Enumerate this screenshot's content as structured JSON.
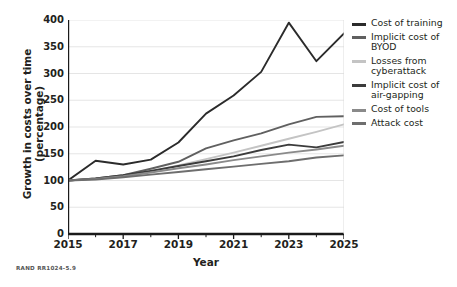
{
  "chart_data": {
    "type": "line",
    "title": "",
    "xlabel": "Year",
    "ylabel": "Growth in costs over time (percentage)",
    "ylabel_lines": [
      "Growth in costs over time",
      "(percentage)"
    ],
    "x": [
      2015,
      2016,
      2017,
      2018,
      2019,
      2020,
      2021,
      2022,
      2023,
      2024,
      2025
    ],
    "xlim": [
      2015,
      2025
    ],
    "ylim": [
      0,
      400
    ],
    "yticks": [
      0,
      50,
      100,
      150,
      200,
      250,
      300,
      350,
      400
    ],
    "xticks_major": [
      2015,
      2017,
      2019,
      2021,
      2023,
      2025
    ],
    "xticks_minor": [
      2016,
      2018,
      2020,
      2022,
      2024
    ],
    "grid": "horizontal",
    "legend_position": "right",
    "series": [
      {
        "name": "Cost of training",
        "color": "#2b2b2b",
        "values": [
          100,
          137,
          130,
          139,
          171,
          225,
          259,
          303,
          395,
          323,
          375
        ]
      },
      {
        "name": "Implicit cost of BYOD",
        "color": "#606060",
        "values": [
          100,
          104,
          110,
          122,
          135,
          160,
          175,
          188,
          205,
          219,
          220
        ]
      },
      {
        "name": "Losses from cyberattack",
        "color": "#c4c4c4",
        "values": [
          100,
          103,
          107,
          117,
          128,
          140,
          152,
          165,
          178,
          191,
          205
        ]
      },
      {
        "name": "Implicit cost of air-gapping",
        "color": "#3c3c3c",
        "values": [
          100,
          104,
          110,
          118,
          127,
          136,
          145,
          157,
          167,
          162,
          172
        ]
      },
      {
        "name": "Cost of tools",
        "color": "#8a8a8a",
        "values": [
          100,
          103,
          108,
          115,
          123,
          130,
          138,
          145,
          152,
          158,
          165
        ]
      },
      {
        "name": "Attack cost",
        "color": "#6e6e6e",
        "values": [
          100,
          102,
          106,
          111,
          116,
          121,
          126,
          131,
          136,
          143,
          147
        ]
      }
    ]
  },
  "legend": {
    "items": [
      {
        "label_lines": [
          "Cost of training"
        ]
      },
      {
        "label_lines": [
          "Implicit cost of",
          "BYOD"
        ]
      },
      {
        "label_lines": [
          "Losses from",
          "cyberattack"
        ]
      },
      {
        "label_lines": [
          "Implicit cost of",
          "air-gapping"
        ]
      },
      {
        "label_lines": [
          "Cost of tools"
        ]
      },
      {
        "label_lines": [
          "Attack cost"
        ]
      }
    ]
  },
  "footer": {
    "source_id": "RAND RR1024-5.9"
  }
}
